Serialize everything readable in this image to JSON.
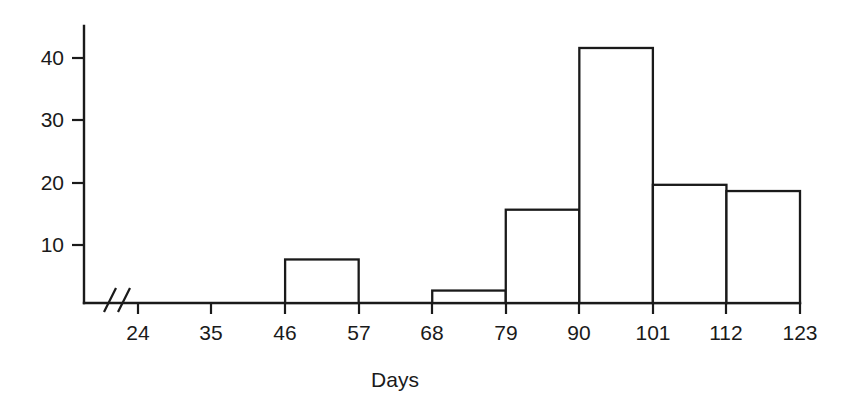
{
  "chart_data": {
    "type": "bar",
    "title": "",
    "subtitle": "",
    "xlabel": "Days",
    "ylabel": "",
    "categories": [
      "24-35",
      "35-46",
      "46-57",
      "57-68",
      "68-79",
      "79-90",
      "90-101",
      "101-112",
      "112-123"
    ],
    "bin_edges": [
      24,
      35,
      46,
      57,
      68,
      79,
      90,
      101,
      112,
      123
    ],
    "values": [
      0,
      0,
      7,
      0,
      2,
      15,
      41,
      19,
      18
    ],
    "x_tick_labels": [
      "24",
      "35",
      "46",
      "57",
      "68",
      "79",
      "90",
      "101",
      "112",
      "123"
    ],
    "y_tick_labels": [
      "10",
      "20",
      "30",
      "40"
    ],
    "y_tick_values": [
      10,
      20,
      30,
      40
    ],
    "xlim": [
      24,
      123
    ],
    "ylim": [
      0,
      45
    ],
    "grid": false,
    "legend": null,
    "axis_break": {
      "axis": "x",
      "glyph": "//",
      "note": "broken x-axis between origin and first tick"
    },
    "annotations": [],
    "colors": {
      "bar_fill": "#ffffff",
      "bar_stroke": "#1a1a1a",
      "axis": "#1a1a1a",
      "text": "#1a1a1a",
      "background": "#ffffff"
    }
  }
}
